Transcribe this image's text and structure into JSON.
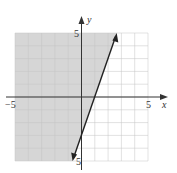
{
  "chart_data": {
    "type": "line",
    "title": "",
    "xlabel": "x",
    "ylabel": "y",
    "xlim": [
      -5,
      5
    ],
    "ylim": [
      -5,
      5
    ],
    "grid": true,
    "x_tick_labels": [
      "-5",
      "5"
    ],
    "y_tick_labels": [
      "5",
      "-5"
    ],
    "series": [
      {
        "name": "boundary line y = 3x - 3",
        "style": "solid",
        "x": [
          -0.67,
          2.67
        ],
        "y": [
          -5,
          5
        ],
        "arrows": "both"
      }
    ],
    "shaded_region": {
      "inequality": "y >= 3x - 3",
      "side": "left/above line",
      "color": "#d9d9d9"
    }
  },
  "labels": {
    "x_axis": "x",
    "y_axis": "y",
    "x_min": "−5",
    "x_max": "5",
    "y_max": "5",
    "y_min": "5"
  },
  "colors": {
    "shade": "#d6d6d6",
    "grid": "#bcbcbc",
    "axis": "#333333",
    "line": "#222222"
  }
}
